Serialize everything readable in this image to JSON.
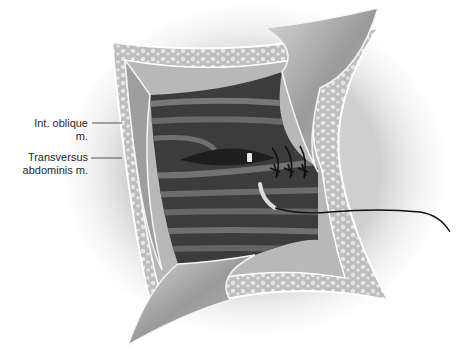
{
  "figure": {
    "labels": [
      {
        "text": "Int. oblique m.",
        "line1": "Int. oblique m."
      },
      {
        "text": "Transversus abdominis m.",
        "line1": "Transversus",
        "line2": "abdominis m."
      }
    ],
    "colors": {
      "background": "#ffffff",
      "muscle_dark": "#3a3a3a",
      "muscle_stripe": "#6e6e6e",
      "retractor": "#a8a8a8",
      "fat_layer": "#c9c9c9",
      "suture": "#111111",
      "leader_line": "#555555"
    }
  }
}
